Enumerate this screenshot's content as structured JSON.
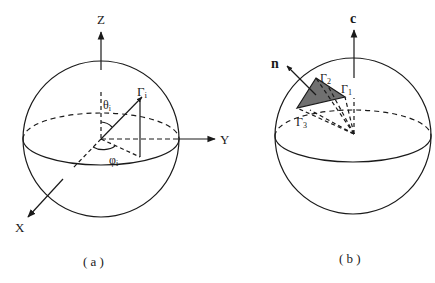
{
  "panel_a": {
    "caption": "( a )",
    "axes": {
      "z": "Z",
      "y": "Y",
      "x": "X"
    },
    "point_label": "Γ",
    "point_sub": "i",
    "theta_label": "θ",
    "theta_sub": "i",
    "phi_label": "φ",
    "phi_sub": "i"
  },
  "panel_b": {
    "caption": "( b )",
    "axis_c": "c",
    "normal": "n",
    "vertices": [
      {
        "label": "Γ",
        "sub": "1"
      },
      {
        "label": "Γ",
        "sub": "2"
      },
      {
        "label": "Γ",
        "sub": "3"
      }
    ]
  },
  "colors": {
    "stroke": "#1a1a1a",
    "triangle_fill": "#707070"
  }
}
